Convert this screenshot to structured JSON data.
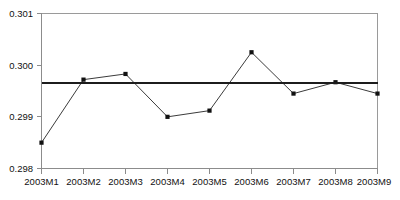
{
  "chart_data": {
    "type": "line",
    "title": "",
    "subtitle": "",
    "xlabel": "",
    "ylabel": "",
    "categories": [
      "2003M1",
      "2003M2",
      "2003M3",
      "2003M4",
      "2003M5",
      "2003M6",
      "2003M7",
      "2003M8",
      "2003M9"
    ],
    "series": [
      {
        "name": "series-1",
        "values": [
          0.2985,
          0.29972,
          0.29983,
          0.299,
          0.29912,
          0.30025,
          0.29945,
          0.29967,
          0.29945
        ],
        "marker": "filled-square",
        "color": "#3b3b3b"
      },
      {
        "name": "mean-reference",
        "values": [
          0.29965,
          0.29965,
          0.29965,
          0.29965,
          0.29965,
          0.29965,
          0.29965,
          0.29965,
          0.29965
        ],
        "marker": "none",
        "color": "#1c1c1c"
      }
    ],
    "ylim": [
      0.298,
      0.301
    ],
    "ytick_labels": [
      "0.301",
      "0.300",
      "0.299",
      "0.298"
    ],
    "ytick_values": [
      0.301,
      0.3,
      0.299,
      0.298
    ],
    "grid": false,
    "legend": "none"
  },
  "axes": {
    "y_top_label": "0.301",
    "y_mid_upper_label": "0.300",
    "y_mid_lower_label": "0.299",
    "y_bottom_label": "0.298"
  },
  "xlabels": {
    "m1": "2003M1",
    "m2": "2003M2",
    "m3": "2003M3",
    "m4": "2003M4",
    "m5": "2003M5",
    "m6": "2003M6",
    "m7": "2003M7",
    "m8": "2003M8",
    "m9": "2003M9"
  },
  "colors": {
    "series": "#3b3b3b",
    "mean": "#1c1c1c",
    "frame": "#9a9a9a",
    "background": "#ffffff"
  }
}
